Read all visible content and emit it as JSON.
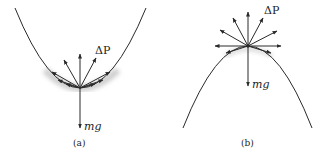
{
  "figure": {
    "panels": [
      {
        "id": "a",
        "caption": "(a)",
        "curve": "upward-opening parabola (valley)",
        "force_labels": {
          "impulse": "ΔP",
          "weight": "mg"
        }
      },
      {
        "id": "b",
        "caption": "(b)",
        "curve": "downward-opening parabola (hill)",
        "force_labels": {
          "impulse": "ΔP",
          "weight": "mg"
        }
      }
    ],
    "colors": {
      "line": "#2a2a2a",
      "shadow": "#cfcfcf",
      "text": "#222222"
    }
  }
}
